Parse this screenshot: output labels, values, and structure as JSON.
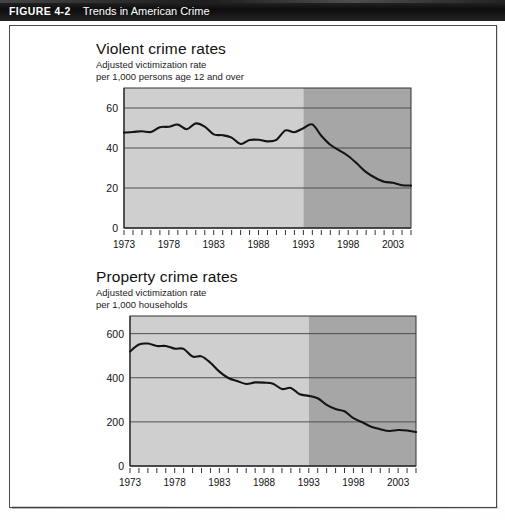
{
  "header": {
    "figure_number": "FIGURE 4-2",
    "figure_title": "Trends in American Crime"
  },
  "panels": [
    {
      "id": "violent",
      "title": "Violent crime rates",
      "subtitle_line1": "Adjusted victimization rate",
      "subtitle_line2": "per 1,000 persons age 12 and over"
    },
    {
      "id": "property",
      "title": "Property crime rates",
      "subtitle_line1": "Adjusted victimization rate",
      "subtitle_line2": "per 1,000 households"
    }
  ],
  "colors": {
    "band_light": "#cfcfcf",
    "band_dark": "#a6a6a6",
    "gridline": "#4f4f4f",
    "series_line": "#141414",
    "axis": "#333333",
    "header_bg": "#121212"
  },
  "footer_text": "",
  "chart_data": [
    {
      "type": "line",
      "title": "Violent crime rates",
      "subtitle": "Adjusted victimization rate per 1,000 persons age 12 and over",
      "xlabel": "",
      "ylabel": "",
      "xlim": [
        1973,
        2005
      ],
      "ylim": [
        0,
        70
      ],
      "yticks": [
        0,
        20,
        40,
        60
      ],
      "ytick_labels": [
        "0",
        "20",
        "40",
        "60"
      ],
      "xticks": [
        1973,
        1978,
        1983,
        1988,
        1993,
        1998,
        2003
      ],
      "xtick_labels": [
        "1973",
        "1978",
        "1983",
        "1988",
        "1993",
        "1998",
        "2003"
      ],
      "minor_xticks_every": 1,
      "grid": "horizontal",
      "legend": "none",
      "shaded_bands": [
        {
          "from": 1973,
          "to": 1993,
          "shade": "light"
        },
        {
          "from": 1993,
          "to": 2005,
          "shade": "dark"
        }
      ],
      "x": [
        1973,
        1974,
        1975,
        1976,
        1977,
        1978,
        1979,
        1980,
        1981,
        1982,
        1983,
        1984,
        1985,
        1986,
        1987,
        1988,
        1989,
        1990,
        1991,
        1992,
        1993,
        1994,
        1995,
        1996,
        1997,
        1998,
        1999,
        2000,
        2001,
        2002,
        2003,
        2004,
        2005
      ],
      "values": [
        47.7,
        48.0,
        48.4,
        48.0,
        50.4,
        50.6,
        51.7,
        49.4,
        52.3,
        50.7,
        46.8,
        46.4,
        45.2,
        42.0,
        44.0,
        44.1,
        43.3,
        44.1,
        48.8,
        47.9,
        49.9,
        51.8,
        46.1,
        41.6,
        38.8,
        36.0,
        32.1,
        27.9,
        25.1,
        23.1,
        22.6,
        21.4,
        21.2
      ],
      "series_name": "Violent victimization rate per 1,000"
    },
    {
      "type": "line",
      "title": "Property crime rates",
      "subtitle": "Adjusted victimization rate per 1,000 households",
      "xlabel": "",
      "ylabel": "",
      "xlim": [
        1973,
        2005
      ],
      "ylim": [
        0,
        680
      ],
      "yticks": [
        0,
        200,
        400,
        600
      ],
      "ytick_labels": [
        "0",
        "200",
        "400",
        "600"
      ],
      "xticks": [
        1973,
        1978,
        1983,
        1988,
        1993,
        1998,
        2003
      ],
      "xtick_labels": [
        "1973",
        "1978",
        "1983",
        "1988",
        "1993",
        "1998",
        "2003"
      ],
      "minor_xticks_every": 1,
      "grid": "horizontal",
      "legend": "none",
      "shaded_bands": [
        {
          "from": 1973,
          "to": 1993,
          "shade": "light"
        },
        {
          "from": 1993,
          "to": 2005,
          "shade": "dark"
        }
      ],
      "x": [
        1973,
        1974,
        1975,
        1976,
        1977,
        1978,
        1979,
        1980,
        1981,
        1982,
        1983,
        1984,
        1985,
        1986,
        1987,
        1988,
        1989,
        1990,
        1991,
        1992,
        1993,
        1994,
        1995,
        1996,
        1997,
        1998,
        1999,
        2000,
        2001,
        2002,
        2003,
        2004,
        2005
      ],
      "values": [
        519,
        551,
        555,
        544,
        544,
        532,
        531,
        496,
        497,
        468,
        428,
        399,
        385,
        372,
        379,
        378,
        373,
        349,
        354,
        325,
        318,
        307,
        277,
        258,
        248,
        217,
        198,
        178,
        167,
        159,
        163,
        161,
        154
      ],
      "series_name": "Property victimization rate per 1,000 households"
    }
  ]
}
